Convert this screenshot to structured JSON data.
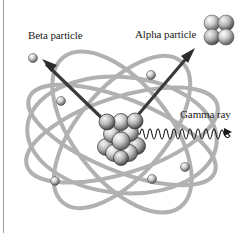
{
  "diagram": {
    "labels": {
      "beta": "Beta particle",
      "alpha": "Alpha particle",
      "gamma": "Gamma ray"
    },
    "colors": {
      "orbit": "#a6a6a6",
      "sphere_light": "#f0f0f0",
      "sphere_dark": "#6a6a6a",
      "arrow": "#3a3a3a",
      "wave": "#1a1a1a",
      "background": "#ffffff"
    },
    "components": [
      {
        "name": "nucleus",
        "description": "Cluster of protons and neutrons at center"
      },
      {
        "name": "beta particle",
        "description": "Single sphere emitted upper-left with arrow"
      },
      {
        "name": "alpha particle",
        "description": "Four-sphere cluster emitted upper-right with arrow"
      },
      {
        "name": "gamma ray",
        "description": "Wave emitted to the right with arrow"
      },
      {
        "name": "electrons",
        "count": 5,
        "description": "Small spheres on elliptical orbits"
      }
    ]
  }
}
